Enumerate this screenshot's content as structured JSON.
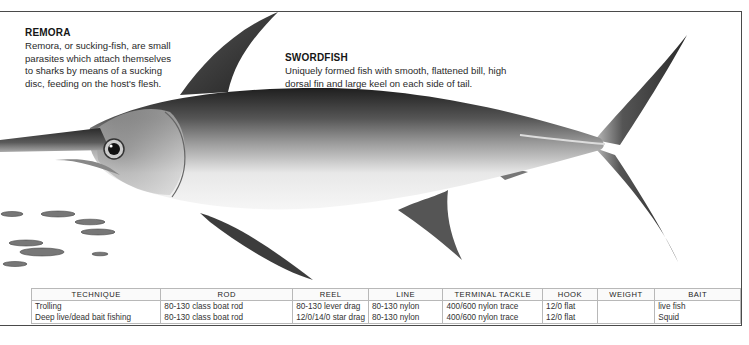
{
  "page": {
    "page_ref": "FISH SPECIES"
  },
  "remora": {
    "title": "REMORA",
    "body": "Remora, or sucking-fish, are small parasites which attach themselves to sharks by means of a sucking disc, feeding on the host's flesh."
  },
  "swordfish": {
    "title": "SWORDFISH",
    "body": "Uniquely formed fish with smooth, flattened bill, high dorsal fin and large keel on each side of tail."
  },
  "illustration": {
    "subject": "swordfish-with-remora-school",
    "colors": {
      "dark_back": "#2b2b2b",
      "mid_gray": "#7a7a7a",
      "belly": "#f2f2f2",
      "fin": "#3a3a3a"
    }
  },
  "table": {
    "headers": [
      "TECHNIQUE",
      "ROD",
      "REEL",
      "LINE",
      "TERMINAL TACKLE",
      "HOOK",
      "WEIGHT",
      "BAIT"
    ],
    "rows": [
      [
        "Trolling",
        "80-130 class boat rod",
        "80-130 lever drag",
        "80-130 nylon",
        "400/600 nylon trace",
        "12/0 flat",
        "",
        "live fish"
      ],
      [
        "Deep live/dead bait fishing",
        "80-130 class boat rod",
        "12/0/14/0 star drag",
        "80-130 nylon",
        "400/600 nylon trace",
        "12/0 flat",
        "",
        "Squid"
      ]
    ]
  }
}
